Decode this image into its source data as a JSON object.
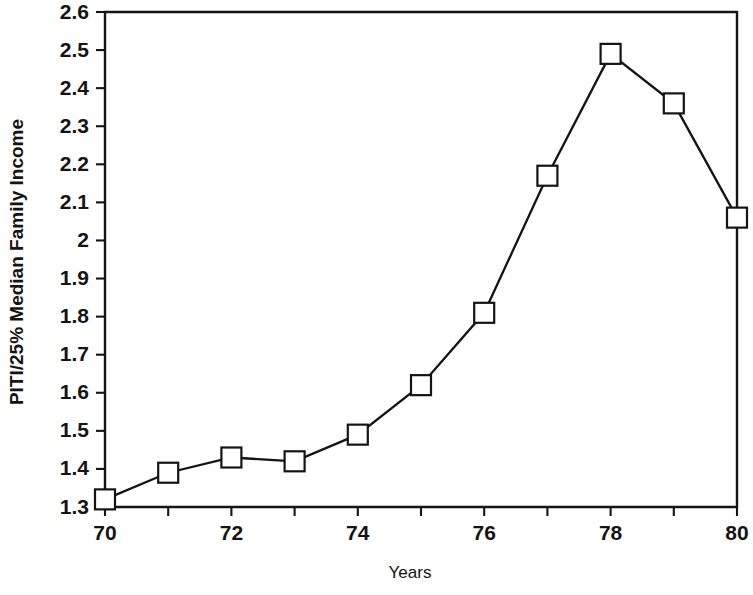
{
  "chart_data": {
    "type": "line",
    "title": "",
    "xlabel": "Years",
    "ylabel": "PITI/25% Median Family Income",
    "x": [
      70,
      71,
      72,
      73,
      74,
      75,
      76,
      77,
      78,
      79,
      80
    ],
    "values": [
      1.32,
      1.39,
      1.43,
      1.42,
      1.49,
      1.62,
      1.81,
      2.17,
      2.49,
      2.36,
      2.06
    ],
    "series": [
      {
        "name": "PITI/25% Median Family Income",
        "values": [
          1.32,
          1.39,
          1.43,
          1.42,
          1.49,
          1.62,
          1.81,
          2.17,
          2.49,
          2.36,
          2.06
        ]
      }
    ],
    "xlim": [
      70,
      80
    ],
    "ylim": [
      1.3,
      2.6
    ],
    "xtick_values": [
      70,
      71,
      72,
      73,
      74,
      75,
      76,
      77,
      78,
      79,
      80
    ],
    "xtick_labels": [
      "70",
      "",
      "72",
      "",
      "74",
      "",
      "76",
      "",
      "78",
      "",
      "80"
    ],
    "ytick_values": [
      1.3,
      1.4,
      1.5,
      1.6,
      1.7,
      1.8,
      1.9,
      2.0,
      2.1,
      2.2,
      2.3,
      2.4,
      2.5,
      2.6
    ],
    "ytick_labels": [
      "1.3",
      "1.4",
      "1.5",
      "1.6",
      "1.7",
      "1.8",
      "1.9",
      "2",
      "2.1",
      "2.2",
      "2.3",
      "2.4",
      "2.5",
      "2.6"
    ],
    "grid": false,
    "legend": "none",
    "marker": "open-square",
    "line_color": "#141414",
    "marker_fill": "#ffffff",
    "background": "#ffffff"
  },
  "axis": {
    "x_title": "Years",
    "y_title": "PITI/25% Median Family Income"
  }
}
